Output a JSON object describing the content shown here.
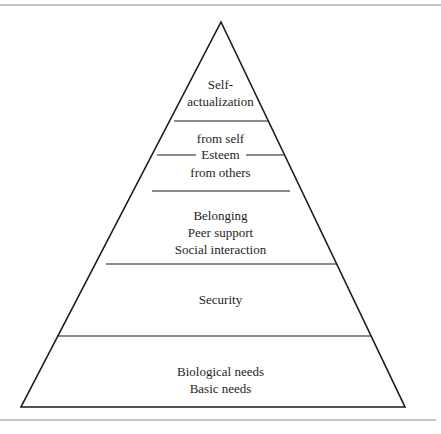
{
  "diagram": {
    "type": "pyramid",
    "levels": [
      {
        "id": "self-actualization",
        "lines": [
          "Self-",
          "actualization"
        ]
      },
      {
        "id": "esteem",
        "top": "from self",
        "middle": "Esteem",
        "bottom": "from others"
      },
      {
        "id": "belonging",
        "lines": [
          "Belonging",
          "Peer support",
          "Social interaction"
        ]
      },
      {
        "id": "security",
        "lines": [
          "Security"
        ]
      },
      {
        "id": "biological",
        "lines": [
          "Biological needs",
          "Basic needs"
        ]
      }
    ],
    "colors": {
      "stroke": "#1a1a1a",
      "rule": "#8a8a8a",
      "text": "#1e1e1e",
      "background": "#ffffff"
    }
  }
}
